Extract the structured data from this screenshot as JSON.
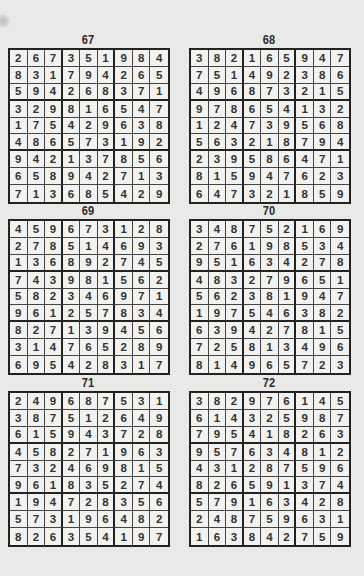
{
  "puzzles": [
    {
      "number": "67",
      "grid": [
        [
          2,
          6,
          7,
          3,
          5,
          1,
          9,
          8,
          4
        ],
        [
          8,
          3,
          1,
          7,
          9,
          4,
          2,
          6,
          5
        ],
        [
          5,
          9,
          4,
          2,
          6,
          8,
          3,
          7,
          1
        ],
        [
          3,
          2,
          9,
          8,
          1,
          6,
          5,
          4,
          7
        ],
        [
          1,
          7,
          5,
          4,
          2,
          9,
          6,
          3,
          8
        ],
        [
          4,
          8,
          6,
          5,
          7,
          3,
          1,
          9,
          2
        ],
        [
          9,
          4,
          2,
          1,
          3,
          7,
          8,
          5,
          6
        ],
        [
          6,
          5,
          8,
          9,
          4,
          2,
          7,
          1,
          3
        ],
        [
          7,
          1,
          3,
          6,
          8,
          5,
          4,
          2,
          9
        ]
      ]
    },
    {
      "number": "68",
      "grid": [
        [
          3,
          8,
          2,
          1,
          6,
          5,
          9,
          4,
          7
        ],
        [
          7,
          5,
          1,
          4,
          9,
          2,
          3,
          8,
          6
        ],
        [
          4,
          9,
          6,
          8,
          7,
          3,
          2,
          1,
          5
        ],
        [
          9,
          7,
          8,
          6,
          5,
          4,
          1,
          3,
          2
        ],
        [
          1,
          2,
          4,
          7,
          3,
          9,
          5,
          6,
          8
        ],
        [
          5,
          6,
          3,
          2,
          1,
          8,
          7,
          9,
          4
        ],
        [
          2,
          3,
          9,
          5,
          8,
          6,
          4,
          7,
          1
        ],
        [
          8,
          1,
          5,
          9,
          4,
          7,
          6,
          2,
          3
        ],
        [
          6,
          4,
          7,
          3,
          2,
          1,
          8,
          5,
          9
        ]
      ]
    },
    {
      "number": "69",
      "grid": [
        [
          4,
          5,
          9,
          6,
          7,
          3,
          1,
          2,
          8
        ],
        [
          2,
          7,
          8,
          5,
          1,
          4,
          6,
          9,
          3
        ],
        [
          1,
          3,
          6,
          8,
          9,
          2,
          7,
          4,
          5
        ],
        [
          7,
          4,
          3,
          9,
          8,
          1,
          5,
          6,
          2
        ],
        [
          5,
          8,
          2,
          3,
          4,
          6,
          9,
          7,
          1
        ],
        [
          9,
          6,
          1,
          2,
          5,
          7,
          8,
          3,
          4
        ],
        [
          8,
          2,
          7,
          1,
          3,
          9,
          4,
          5,
          6
        ],
        [
          3,
          1,
          4,
          7,
          6,
          5,
          2,
          8,
          9
        ],
        [
          6,
          9,
          5,
          4,
          2,
          8,
          3,
          1,
          7
        ]
      ]
    },
    {
      "number": "70",
      "grid": [
        [
          3,
          4,
          8,
          7,
          5,
          2,
          1,
          6,
          9
        ],
        [
          2,
          7,
          6,
          1,
          9,
          8,
          5,
          3,
          4
        ],
        [
          9,
          5,
          1,
          6,
          3,
          4,
          2,
          7,
          8
        ],
        [
          4,
          8,
          3,
          2,
          7,
          9,
          6,
          5,
          1
        ],
        [
          5,
          6,
          2,
          3,
          8,
          1,
          9,
          4,
          7
        ],
        [
          1,
          9,
          7,
          5,
          4,
          6,
          3,
          8,
          2
        ],
        [
          6,
          3,
          9,
          4,
          2,
          7,
          8,
          1,
          5
        ],
        [
          7,
          2,
          5,
          8,
          1,
          3,
          4,
          9,
          6
        ],
        [
          8,
          1,
          4,
          9,
          6,
          5,
          7,
          2,
          3
        ]
      ]
    },
    {
      "number": "71",
      "grid": [
        [
          2,
          4,
          9,
          6,
          8,
          7,
          5,
          3,
          1
        ],
        [
          3,
          8,
          7,
          5,
          1,
          2,
          6,
          4,
          9
        ],
        [
          6,
          1,
          5,
          9,
          4,
          3,
          7,
          2,
          8
        ],
        [
          4,
          5,
          8,
          2,
          7,
          1,
          9,
          6,
          3
        ],
        [
          7,
          3,
          2,
          4,
          6,
          9,
          8,
          1,
          5
        ],
        [
          9,
          6,
          1,
          8,
          3,
          5,
          2,
          7,
          4
        ],
        [
          1,
          9,
          4,
          7,
          2,
          8,
          3,
          5,
          6
        ],
        [
          5,
          7,
          3,
          1,
          9,
          6,
          4,
          8,
          2
        ],
        [
          8,
          2,
          6,
          3,
          5,
          4,
          1,
          9,
          7
        ]
      ]
    },
    {
      "number": "72",
      "grid": [
        [
          3,
          8,
          2,
          9,
          7,
          6,
          1,
          4,
          5
        ],
        [
          6,
          1,
          4,
          3,
          2,
          5,
          9,
          8,
          7
        ],
        [
          7,
          9,
          5,
          4,
          1,
          8,
          2,
          6,
          3
        ],
        [
          9,
          5,
          7,
          6,
          3,
          4,
          8,
          1,
          2
        ],
        [
          4,
          3,
          1,
          2,
          8,
          7,
          5,
          9,
          6
        ],
        [
          8,
          2,
          6,
          5,
          9,
          1,
          3,
          7,
          4
        ],
        [
          5,
          7,
          9,
          1,
          6,
          3,
          4,
          2,
          8
        ],
        [
          2,
          4,
          8,
          7,
          5,
          9,
          6,
          3,
          1
        ],
        [
          1,
          6,
          3,
          8,
          4,
          2,
          7,
          5,
          9
        ]
      ]
    }
  ]
}
